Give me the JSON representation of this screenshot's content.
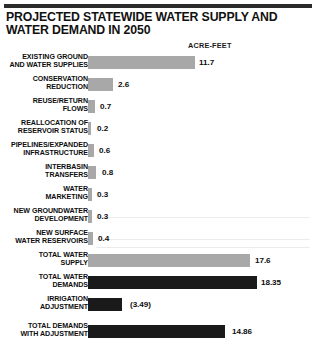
{
  "title": "PROJECTED STATEWIDE WATER SUPPLY AND WATER DEMAND IN 2050",
  "units_label": "ACRE-FEET",
  "chart_data": {
    "type": "bar",
    "orientation": "horizontal",
    "title": "PROJECTED STATEWIDE WATER SUPPLY AND WATER DEMAND IN 2050",
    "xlabel": "",
    "ylabel": "",
    "units": "ACRE-FEET",
    "grid": false,
    "legend": "none",
    "xlim": [
      0,
      19
    ],
    "categories": [
      "EXISTING GROUND AND WATER SUPPLIES",
      "CONSERVATION REDUCTION",
      "REUSE/RETURN FLOWS",
      "REALLOCATION OF RESERVOIR STATUS",
      "PIPELINES/EXPANDED INFRASTRUCTURE",
      "INTERBASIN TRANSFERS",
      "WATER MARKETING",
      "NEW GROUNDWATER DEVELOPMENT",
      "NEW SURFACE WATER RESERVOIRS",
      "TOTAL WATER SUPPLY",
      "TOTAL WATER DEMANDS",
      "IRRIGATION ADJUSTMENT",
      "TOTAL DEMANDS WITH ADJUSTMENT"
    ],
    "values": [
      11.7,
      2.6,
      0.7,
      0.2,
      0.6,
      0.8,
      0.3,
      0.3,
      0.4,
      17.6,
      18.35,
      -3.49,
      14.86
    ],
    "value_labels": [
      "11.7",
      "2.6",
      "0.7",
      "0.2",
      "0.6",
      "0.8",
      "0.3",
      "0.3",
      "0.4",
      "17.6",
      "18.35",
      "(3.49)",
      "14.86"
    ]
  },
  "colors": {
    "bar_light": "#a8a8a8",
    "bar_dark": "#1a1a1a",
    "rule": "#2b2b2b",
    "text": "#0d0d0d",
    "background": "#ffffff"
  },
  "rows": [
    {
      "label": "EXISTING GROUND\nAND WATER SUPPLIES",
      "value_label": "11.7",
      "value": 11.7,
      "shade": "light",
      "top": 5,
      "label_top": 2,
      "bar_width": 107,
      "val_left": 199,
      "val_top": 7
    },
    {
      "label": "CONSERVATION\nREDUCTION",
      "value_label": "2.6",
      "value": 2.6,
      "shade": "light",
      "top": 27,
      "label_top": 24,
      "bar_width": 25,
      "val_left": 118,
      "val_top": 29
    },
    {
      "label": "REUSE/RETURN\nFLOWS",
      "value_label": "0.7",
      "value": 0.7,
      "shade": "light",
      "top": 49,
      "label_top": 46,
      "bar_width": 7,
      "val_left": 100,
      "val_top": 51
    },
    {
      "label": "REALLOCATION OF\nRESERVOIR STATUS",
      "value_label": "0.2",
      "value": 0.2,
      "shade": "light",
      "top": 71,
      "label_top": 68,
      "bar_width": 3,
      "val_left": 97,
      "val_top": 73
    },
    {
      "label": "PIPELINES/EXPANDED\nINFRASTRUCTURE",
      "value_label": "0.6",
      "value": 0.6,
      "shade": "light",
      "top": 93,
      "label_top": 90,
      "bar_width": 6,
      "val_left": 99,
      "val_top": 95
    },
    {
      "label": "INTERBASIN\nTRANSFERS",
      "value_label": "0.8",
      "value": 0.8,
      "shade": "light",
      "top": 115,
      "label_top": 112,
      "bar_width": 8,
      "val_left": 102,
      "val_top": 117
    },
    {
      "label": "WATER\nMARKETING",
      "value_label": "0.3",
      "value": 0.3,
      "shade": "light",
      "top": 137,
      "label_top": 134,
      "bar_width": 4,
      "val_left": 97,
      "val_top": 139
    },
    {
      "label": "NEW GROUNDWATER\nDEVELOPMENT",
      "value_label": "0.3",
      "value": 0.3,
      "shade": "light",
      "top": 159,
      "label_top": 156,
      "bar_width": 4,
      "val_left": 97,
      "val_top": 161
    },
    {
      "label": "NEW SURFACE\nWATER RESERVOIRS",
      "value_label": "0.4",
      "value": 0.4,
      "shade": "light",
      "top": 181,
      "label_top": 178,
      "bar_width": 5,
      "val_left": 98,
      "val_top": 183
    },
    {
      "label": "TOTAL WATER\nSUPPLY",
      "value_label": "17.6",
      "value": 17.6,
      "shade": "light",
      "top": 203,
      "label_top": 200,
      "bar_width": 162,
      "val_left": 255,
      "val_top": 205
    },
    {
      "label": "TOTAL WATER\nDEMANDS",
      "value_label": "18.35",
      "value": 18.35,
      "shade": "dark",
      "top": 225,
      "label_top": 222,
      "bar_width": 169,
      "val_left": 261,
      "val_top": 227
    },
    {
      "label": "IRRIGATION\nADJUSTMENT",
      "value_label": "(3.49)",
      "value": -3.49,
      "shade": "dark",
      "top": 247,
      "label_top": 244,
      "bar_width": 34,
      "val_left": 130,
      "val_top": 249
    },
    {
      "label": "TOTAL DEMANDS\nWITH ADJUSTMENT",
      "value_label": "14.86",
      "value": 14.86,
      "shade": "dark",
      "top": 274,
      "label_top": 271,
      "bar_width": 137,
      "val_left": 232,
      "val_top": 276
    }
  ],
  "scanlines": [
    166,
    188,
    196
  ]
}
